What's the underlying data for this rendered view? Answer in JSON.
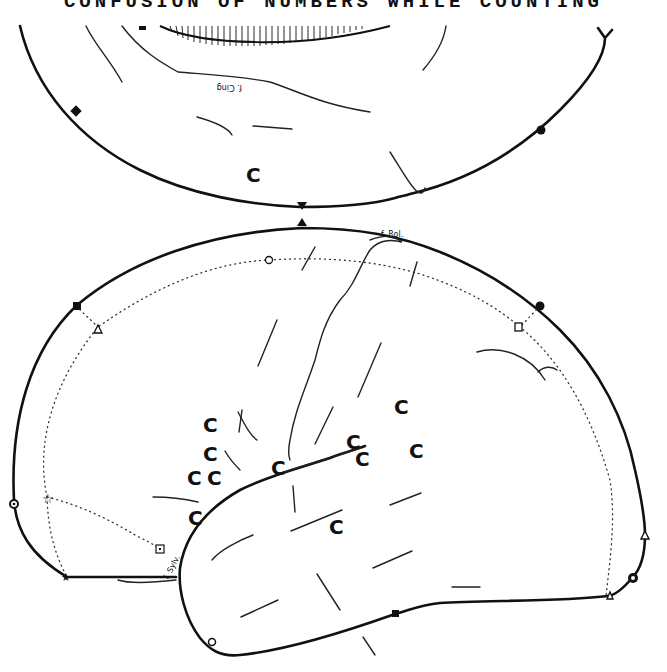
{
  "figure": {
    "title": "CONFUSION OF NUMBERS WHILE COUNTING",
    "stimulation_marker": "C",
    "labels": {
      "cingulate_fissure": "f. Cing",
      "rolandic_fissure": "f. Rol.",
      "sylvian_fissure": "f. Sylv."
    },
    "medial_view": {
      "c_points": [
        {
          "x": 253,
          "y": 174
        }
      ]
    },
    "lateral_view": {
      "c_points": [
        {
          "x": 210,
          "y": 425
        },
        {
          "x": 210,
          "y": 454
        },
        {
          "x": 194,
          "y": 478
        },
        {
          "x": 214,
          "y": 478
        },
        {
          "x": 278,
          "y": 468
        },
        {
          "x": 353,
          "y": 442
        },
        {
          "x": 362,
          "y": 458
        },
        {
          "x": 401,
          "y": 407
        },
        {
          "x": 416,
          "y": 451
        },
        {
          "x": 195,
          "y": 518
        },
        {
          "x": 336,
          "y": 527
        }
      ]
    },
    "marker_symbols": [
      "filled-square",
      "filled-circle",
      "filled-triangle",
      "open-circle",
      "open-triangle",
      "open-square",
      "open-star",
      "filled-star",
      "circled-dot",
      "dotted-square"
    ]
  }
}
